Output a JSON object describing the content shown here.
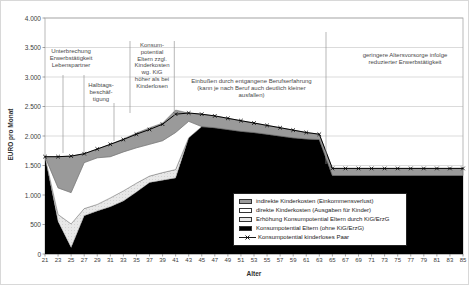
{
  "chart_data": {
    "type": "area",
    "title": "",
    "xlabel": "Alter",
    "ylabel": "EURO pro Monat",
    "ylim": [
      0,
      4000
    ],
    "ytick_labels": [
      "0",
      "500",
      "1.000",
      "1.500",
      "2.000",
      "2.500",
      "3.000",
      "3.500",
      "4.000"
    ],
    "grid": "horizontal",
    "x": [
      21,
      23,
      25,
      27,
      29,
      31,
      33,
      35,
      37,
      39,
      41,
      43,
      45,
      47,
      49,
      51,
      53,
      55,
      57,
      59,
      61,
      63,
      65,
      67,
      69,
      71,
      73,
      75,
      77,
      79,
      81,
      83,
      85
    ],
    "series": [
      {
        "name": "Konsumpotential Eltern (ohne KiG/ErzG)",
        "role": "stack-area",
        "swatch": "parents",
        "values": [
          1650,
          550,
          110,
          650,
          730,
          800,
          900,
          1050,
          1210,
          1250,
          1290,
          1970,
          2160,
          2140,
          2110,
          2080,
          2060,
          2030,
          2000,
          1970,
          1950,
          1940,
          1330,
          1330,
          1330,
          1330,
          1330,
          1330,
          1330,
          1330,
          1330,
          1330,
          1330
        ]
      },
      {
        "name": "Erhöhung Konsumpotential Eltern durch KiG/ErzG",
        "role": "stack-area",
        "swatch": "kig",
        "values": [
          0,
          120,
          400,
          120,
          110,
          150,
          170,
          150,
          110,
          130,
          140,
          0,
          0,
          0,
          0,
          0,
          0,
          0,
          0,
          0,
          0,
          0,
          0,
          0,
          0,
          0,
          0,
          0,
          0,
          0,
          0,
          0,
          0
        ]
      },
      {
        "name": "direkte Kinderkosten (Ausgaben für Kinder)",
        "role": "stack-area",
        "swatch": "direct",
        "values": [
          0,
          450,
          530,
          780,
          790,
          700,
          660,
          600,
          540,
          540,
          630,
          280,
          0,
          0,
          0,
          0,
          0,
          0,
          0,
          0,
          0,
          0,
          0,
          0,
          0,
          0,
          0,
          0,
          0,
          0,
          0,
          0,
          0
        ]
      },
      {
        "name": "indirekte Kinderkosten (Einkommensverlust)",
        "role": "stack-area",
        "swatch": "indirect",
        "values": [
          0,
          530,
          620,
          150,
          150,
          210,
          220,
          250,
          280,
          300,
          380,
          140,
          210,
          200,
          190,
          180,
          160,
          150,
          140,
          130,
          110,
          90,
          120,
          120,
          120,
          120,
          120,
          120,
          120,
          120,
          120,
          120,
          120
        ]
      },
      {
        "name": "Konsumpotential kinderloses Paar",
        "role": "line",
        "swatch": "line",
        "marker": "x",
        "values": [
          1650,
          1650,
          1660,
          1700,
          1780,
          1860,
          1940,
          2030,
          2110,
          2200,
          2370,
          2390,
          2370,
          2340,
          2300,
          2260,
          2220,
          2180,
          2140,
          2100,
          2060,
          2030,
          1450,
          1450,
          1450,
          1450,
          1450,
          1450,
          1450,
          1450,
          1450,
          1450,
          1450
        ]
      }
    ],
    "legend": [
      {
        "label": "indirekte Kinderkosten (Einkommensverlust)",
        "swatch": "indirect"
      },
      {
        "label": "direkte Kinderkosten (Ausgaben für Kinder)",
        "swatch": "direct"
      },
      {
        "label": "Erhöhung Konsumpotential Eltern durch KiG/ErzG",
        "swatch": "kig"
      },
      {
        "label": "Konsumpotential Eltern (ohne KiG/ErzG)",
        "swatch": "parents"
      },
      {
        "label": "Konsumpotential kinderloses Paar",
        "swatch": "line"
      }
    ],
    "annotations": [
      {
        "id": "unterbrechung",
        "text": "Unterbrechung\nErwerbstätigkeit\nLebenspartner"
      },
      {
        "id": "halbtags",
        "text": "Halbtags-\nbeschäf-\ntigung"
      },
      {
        "id": "konsumpotential-kig",
        "text": "Konsum-\npotential\nEltern zzgl.\nKinderkosten\nwg. KiG\nhöher als bei\nKinderlosen"
      },
      {
        "id": "einbussen",
        "text": "Einbußen durch entgangene Berufserfahrung\n(kann je nach Beruf auch deutlich kleiner ausfallen)"
      },
      {
        "id": "altersvorsorge",
        "text": "geringere Altersvorsorge infolge\nreduzierter Erwerbstätigkeit"
      }
    ],
    "colors": {
      "parents": "#000000",
      "kig": "#e8e8e8",
      "direct": "#ffffff",
      "indirect": "#9a9a9a",
      "line": "#000000",
      "grid": "#cccccc",
      "frame": "#a8a8a8",
      "annotation_line": "#999999"
    }
  }
}
